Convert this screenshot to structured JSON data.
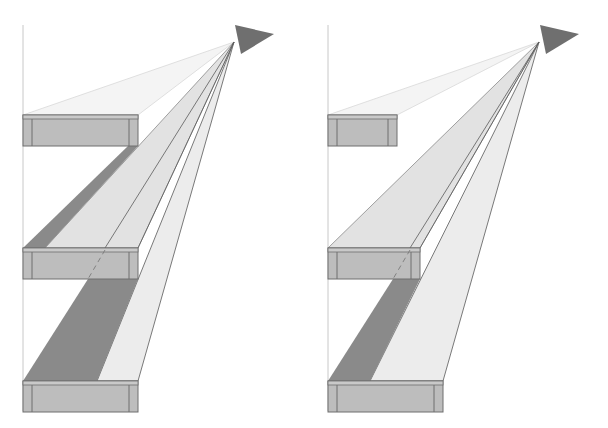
{
  "diagram": {
    "title": "Light source illuminating shelves with cast shadows",
    "panels": [
      {
        "name": "left-panel",
        "description": "Wide shelves: upper shelves cast shadows on lower shelves",
        "shelves": [
          "top-shelf",
          "middle-shelf",
          "bottom-shelf"
        ],
        "light_source": "lamp"
      },
      {
        "name": "right-panel",
        "description": "Shorter upper shelves: more light reaches lower shelves",
        "shelves": [
          "top-shelf",
          "middle-shelf",
          "bottom-shelf"
        ],
        "light_source": "lamp"
      }
    ],
    "colors": {
      "background": "#ffffff",
      "wall": "#c8c8c8",
      "shelf_face": "#bdbdbd",
      "shelf_top": "#c9c9c9",
      "shelf_edge": "#6e6e6e",
      "lamp": "#6f6f6f",
      "light_faint": "#f4f4f4",
      "light_mid": "#e2e2e2",
      "light_bright": "#ececec",
      "shadow": "#8a8a8a",
      "ray_line": "#5a5a5a"
    }
  }
}
